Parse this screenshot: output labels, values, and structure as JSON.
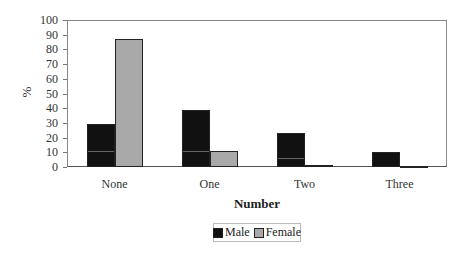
{
  "chart_data": {
    "type": "bar",
    "title": "",
    "xlabel": "Number",
    "ylabel": "%",
    "ylim": [
      0,
      100
    ],
    "yticks": [
      0,
      10,
      20,
      30,
      40,
      50,
      60,
      70,
      80,
      90,
      100
    ],
    "categories": [
      "None",
      "One",
      "Two",
      "Three"
    ],
    "series": [
      {
        "name": "Male",
        "color": "#111111",
        "values": [
          29,
          39,
          23,
          10
        ]
      },
      {
        "name": "Female",
        "color": "#a9a9a9",
        "values": [
          87,
          11,
          1.5,
          0.5
        ]
      }
    ],
    "grid": false,
    "legend_position": "bottom"
  }
}
